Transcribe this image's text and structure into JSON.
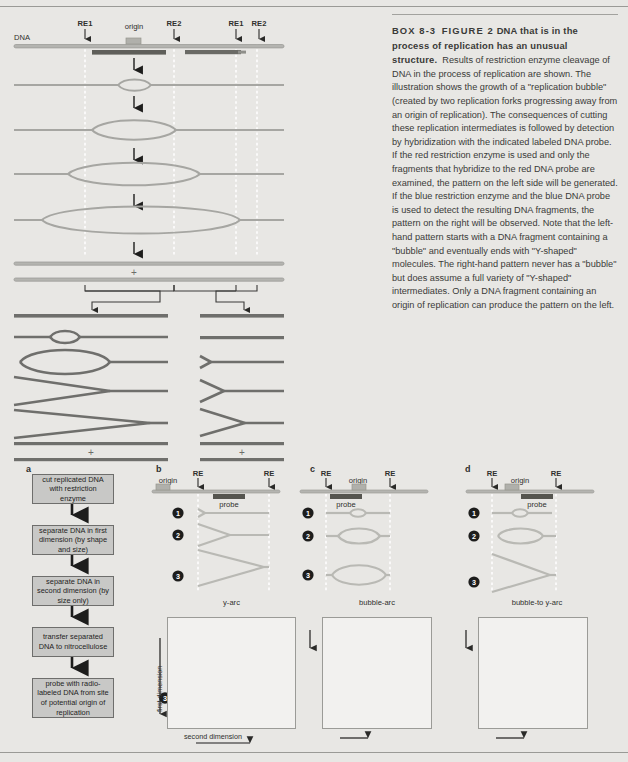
{
  "caption": {
    "box_number": "BOX 8-3",
    "figure_number": "FIGURE 2",
    "title": "DNA that is in the process of replication has an unusual structure.",
    "body": "Results of restriction enzyme cleavage of DNA in the process of replication are shown. The illustration shows the growth of a \"replication bubble\" (created by two replication forks progressing away from an origin of replication). The consequences of cutting these replication intermediates is followed by detection by hybridization with the indicated labeled DNA probe. If the red restriction enzyme is used and only the fragments that hybridize to the red DNA probe are examined, the pattern on the left side will be generated. If the blue restriction enzyme and the blue DNA probe is used to detect the resulting DNA fragments, the pattern on the right will be observed. Note that the left-hand pattern starts with a DNA fragment containing a \"bubble\" and eventually ends with \"Y-shaped\" molecules. The right-hand pattern never has a \"bubble\" but does assume a full variety of \"Y-shaped\" intermediates. Only a DNA fragment containing an origin of replication can produce the pattern on the left."
  },
  "top_diagram": {
    "dna_label": "DNA",
    "origin_label": "origin",
    "site_labels": [
      "RE1",
      "RE2",
      "RE1",
      "RE2"
    ],
    "plus_marks": [
      "+",
      "+",
      "+"
    ],
    "bubble_stages": 4
  },
  "panel_a": {
    "letter": "a",
    "steps": [
      "cut replicated DNA with restriction enzyme",
      "separate DNA in first dimension (by shape and size)",
      "separate DNA in second dimension (by size only)",
      "transfer separated DNA to nitrocellulose",
      "probe with radio-labeled DNA from site of potential origin of replication"
    ]
  },
  "panel_b": {
    "letter": "b",
    "origin_label": "origin",
    "re_labels": [
      "RE",
      "RE"
    ],
    "probe_label": "probe",
    "stage_numbers": [
      "1",
      "2",
      "3"
    ],
    "arc_label": "y-arc",
    "gel": {
      "first_dimension": "first dimension",
      "second_dimension": "second dimension",
      "spots": [
        "1",
        "2",
        "3"
      ]
    }
  },
  "panel_c": {
    "letter": "c",
    "origin_label": "origin",
    "re_labels": [
      "RE",
      "RE"
    ],
    "probe_label": "probe",
    "stage_numbers": [
      "1",
      "2",
      "3"
    ],
    "arc_label": "bubble-arc",
    "gel": {
      "spots": [
        "1",
        "2",
        "3"
      ]
    }
  },
  "panel_d": {
    "letter": "d",
    "origin_label": "origin",
    "re_labels": [
      "RE",
      "RE"
    ],
    "probe_label": "probe",
    "stage_numbers": [
      "1",
      "2",
      "3"
    ],
    "arc_label": "bubble-to y-arc",
    "gel": {
      "spots": [
        "1",
        "2",
        "3"
      ]
    }
  },
  "colors": {
    "page_bg": "#e8e7e4",
    "dna_line": "#9d9d99",
    "dna_dark": "#6f6f6c",
    "probe_dark": "#55554f",
    "box_fill": "#c8c8c6",
    "arc_black": "#161616",
    "gel_bg": "#f2f1ef"
  }
}
